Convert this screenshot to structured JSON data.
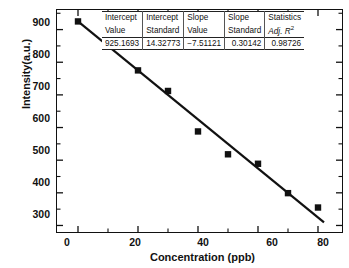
{
  "chart_data": {
    "type": "scatter",
    "title": "",
    "xlabel": "Concentration (ppb)",
    "ylabel": "Intensity(a.u.)",
    "xlim": [
      -7,
      88
    ],
    "ylim": [
      280,
      960
    ],
    "xticks": [
      0,
      20,
      40,
      60,
      80
    ],
    "yticks": [
      300,
      400,
      500,
      600,
      700,
      800,
      900
    ],
    "grid": false,
    "legend": "none",
    "series": [
      {
        "name": "measured",
        "marker": "filled-square",
        "color": "#111111",
        "x": [
          0,
          10,
          20,
          30,
          40,
          50,
          60,
          70,
          80
        ],
        "y": [
          925,
          862,
          775,
          712,
          588,
          518,
          489,
          399,
          355
        ]
      }
    ],
    "fit_line": {
      "name": "linear fit",
      "color": "#111111",
      "intercept": 925.1693,
      "slope": -7.51121,
      "x_range": [
        0,
        82
      ]
    }
  },
  "stats_table": {
    "headers_line1": [
      "Intercept",
      "Intercept",
      "Slope",
      "Slope",
      "Statistics"
    ],
    "headers_line2": [
      "Value",
      "Standard",
      "Value",
      "Standard",
      "Adj. R"
    ],
    "adj_r_superscript": "2",
    "values": [
      "925.1693",
      "14.32773",
      "−7.51121",
      "0.30142",
      "0.98726"
    ]
  },
  "axes": {
    "x_tick_labels": [
      "0",
      "20",
      "40",
      "60",
      "80"
    ],
    "y_tick_labels": [
      "300",
      "400",
      "500",
      "600",
      "700",
      "800",
      "900"
    ]
  }
}
